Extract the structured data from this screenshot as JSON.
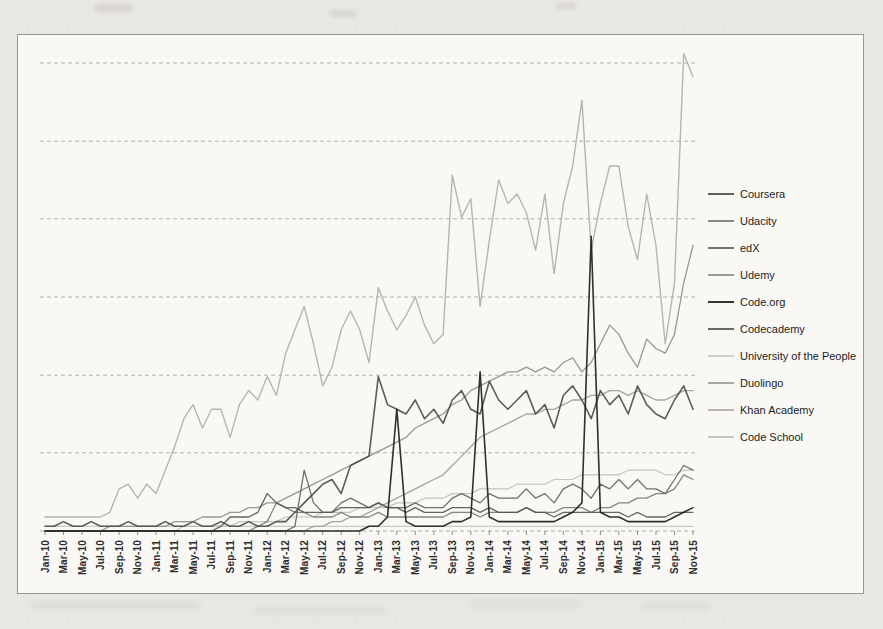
{
  "page": {
    "kind": "scanned book figure of an Excel-style line chart",
    "title": "",
    "background_color": "#e9e7e2",
    "plot_background_color": "#f9f8f4",
    "gridline_color": "#b0aea7",
    "frame_color": "#98968f"
  },
  "chart_data": {
    "type": "line",
    "title": "",
    "xlabel": "",
    "ylabel": "",
    "y_axis_labeled": false,
    "ylim": [
      0,
      105
    ],
    "y_gridline_values": [
      0,
      16.7,
      33.3,
      50,
      66.7,
      83.3,
      100
    ],
    "grid": "horizontal-only",
    "legend_position": "right",
    "n_points": 71,
    "x_points_per_label": 2,
    "x_range": "Jan-10 to Nov-15, monthly",
    "x_tick_labels": [
      "Jan-10",
      "Mar-10",
      "May-10",
      "Jul-10",
      "Sep-10",
      "Nov-10",
      "Jan-11",
      "Mar-11",
      "May-11",
      "Jul-11",
      "Sep-11",
      "Nov-11",
      "Jan-12",
      "Mar-12",
      "May-12",
      "Jul-12",
      "Sep-12",
      "Nov-12",
      "Jan-13",
      "Mar-13",
      "May-13",
      "Jul-13",
      "Sep-13",
      "Nov-13",
      "Jan-14",
      "Mar-14",
      "May-14",
      "Jul-14",
      "Sep-14",
      "Nov-14",
      "Jan-15",
      "Mar-15",
      "May-15",
      "Jul-15",
      "Sep-15",
      "Nov-15"
    ],
    "series": [
      {
        "name": "Coursera",
        "color": "#4e4e4e",
        "width": 1.6,
        "values": [
          1,
          1,
          2,
          1,
          1,
          2,
          1,
          1,
          1,
          2,
          1,
          1,
          1,
          2,
          1,
          1,
          2,
          1,
          1,
          2,
          1,
          1,
          2,
          1,
          1,
          2,
          2,
          4,
          6,
          8,
          10,
          11,
          8,
          14,
          15,
          16,
          33,
          27,
          26,
          25,
          28,
          24,
          26,
          23,
          28,
          30,
          26,
          25,
          32,
          28,
          26,
          28,
          30,
          25,
          27,
          22,
          29,
          31,
          28,
          24,
          30,
          27,
          29,
          25,
          31,
          27,
          25,
          24,
          28,
          31,
          26
        ]
      },
      {
        "name": "Udacity",
        "color": "#7b7b7b",
        "width": 1.3,
        "values": [
          0,
          0,
          0,
          0,
          0,
          0,
          0,
          0,
          0,
          0,
          0,
          0,
          0,
          0,
          0,
          0,
          0,
          0,
          0,
          0,
          0,
          0,
          0,
          1,
          2,
          6,
          5,
          4,
          4,
          3,
          3,
          3,
          4,
          3,
          3,
          3,
          4,
          3,
          3,
          3,
          3,
          3,
          3,
          3,
          4,
          4,
          4,
          3,
          4,
          4,
          4,
          4,
          5,
          4,
          4,
          4,
          5,
          5,
          5,
          4,
          5,
          5,
          6,
          6,
          7,
          7,
          8,
          8,
          9,
          12,
          11
        ]
      },
      {
        "name": "edX",
        "color": "#646464",
        "width": 1.3,
        "values": [
          0,
          0,
          0,
          0,
          0,
          0,
          0,
          0,
          0,
          0,
          0,
          0,
          0,
          0,
          0,
          0,
          0,
          0,
          0,
          0,
          0,
          0,
          0,
          0,
          0,
          0,
          0,
          1,
          13,
          6,
          4,
          4,
          6,
          7,
          6,
          5,
          6,
          5,
          5,
          5,
          6,
          5,
          5,
          5,
          7,
          8,
          7,
          6,
          8,
          7,
          7,
          7,
          9,
          7,
          8,
          6,
          9,
          10,
          9,
          7,
          10,
          9,
          11,
          9,
          11,
          9,
          9,
          8,
          11,
          14,
          13
        ]
      },
      {
        "name": "Udemy",
        "color": "#8f8f8f",
        "width": 1.3,
        "values": [
          0,
          0,
          0,
          0,
          0,
          0,
          0,
          1,
          1,
          1,
          1,
          1,
          1,
          1,
          2,
          2,
          2,
          3,
          3,
          3,
          4,
          4,
          5,
          5,
          6,
          6,
          7,
          8,
          9,
          10,
          11,
          12,
          13,
          14,
          15,
          16,
          17,
          18,
          19,
          20,
          22,
          23,
          24,
          25,
          27,
          28,
          30,
          31,
          32,
          33,
          34,
          34,
          35,
          34,
          35,
          34,
          36,
          37,
          34,
          36,
          40,
          44,
          42,
          38,
          35,
          41,
          39,
          38,
          42,
          53,
          61
        ]
      },
      {
        "name": "Code.org",
        "color": "#1e1e1e",
        "width": 1.6,
        "values": [
          0,
          0,
          0,
          0,
          0,
          0,
          0,
          0,
          0,
          0,
          0,
          0,
          0,
          0,
          0,
          0,
          0,
          0,
          0,
          0,
          0,
          0,
          0,
          0,
          0,
          0,
          0,
          0,
          0,
          0,
          0,
          0,
          0,
          0,
          0,
          1,
          1,
          3,
          26,
          2,
          1,
          1,
          1,
          1,
          2,
          2,
          3,
          34,
          3,
          2,
          2,
          2,
          2,
          2,
          2,
          2,
          3,
          4,
          6,
          63,
          4,
          3,
          3,
          2,
          2,
          2,
          2,
          2,
          3,
          4,
          5
        ]
      },
      {
        "name": "Codecademy",
        "color": "#585858",
        "width": 1.3,
        "values": [
          0,
          0,
          0,
          0,
          0,
          0,
          0,
          0,
          0,
          0,
          0,
          0,
          0,
          0,
          0,
          0,
          0,
          0,
          0,
          1,
          3,
          3,
          3,
          4,
          8,
          6,
          5,
          5,
          4,
          4,
          4,
          4,
          5,
          5,
          5,
          5,
          6,
          5,
          5,
          4,
          5,
          4,
          4,
          4,
          5,
          5,
          5,
          4,
          5,
          4,
          4,
          4,
          5,
          4,
          4,
          3,
          4,
          4,
          4,
          4,
          4,
          4,
          4,
          3,
          4,
          3,
          3,
          3,
          4,
          4,
          4
        ]
      },
      {
        "name": "University of the People",
        "color": "#c6c6c6",
        "width": 1.2,
        "values": [
          1,
          1,
          1,
          1,
          1,
          1,
          1,
          1,
          1,
          1,
          1,
          1,
          1,
          1,
          1,
          1,
          1,
          1,
          1,
          1,
          1,
          1,
          1,
          1,
          1,
          1,
          1,
          1,
          1,
          1,
          1,
          1,
          1,
          1,
          1,
          1,
          1,
          1,
          1,
          1,
          1,
          1,
          1,
          1,
          1,
          1,
          1,
          1,
          1,
          1,
          1,
          1,
          1,
          1,
          1,
          1,
          1,
          1,
          1,
          1,
          1,
          1,
          1,
          1,
          1,
          1,
          1,
          1,
          1,
          1,
          1
        ]
      },
      {
        "name": "Duolingo",
        "color": "#9d9d9d",
        "width": 1.3,
        "values": [
          0,
          0,
          0,
          0,
          0,
          0,
          0,
          0,
          0,
          0,
          0,
          0,
          0,
          0,
          0,
          0,
          0,
          0,
          0,
          0,
          0,
          0,
          0,
          0,
          0,
          0,
          0,
          0,
          0,
          1,
          1,
          2,
          2,
          3,
          3,
          4,
          5,
          6,
          7,
          8,
          9,
          10,
          11,
          12,
          14,
          16,
          18,
          20,
          21,
          22,
          23,
          24,
          25,
          25,
          26,
          26,
          27,
          28,
          28,
          29,
          29,
          30,
          30,
          29,
          30,
          29,
          28,
          28,
          29,
          30,
          30
        ]
      },
      {
        "name": "Khan Academy",
        "color": "#b1afa9",
        "width": 1.4,
        "values": [
          3,
          3,
          3,
          3,
          3,
          3,
          3,
          4,
          9,
          10,
          7,
          10,
          8,
          13,
          18,
          24,
          27,
          22,
          26,
          26,
          20,
          27,
          30,
          28,
          33,
          29,
          38,
          43,
          48,
          40,
          31,
          35,
          43,
          47,
          43,
          36,
          52,
          47,
          43,
          46,
          50,
          44,
          40,
          42,
          76,
          67,
          71,
          48,
          62,
          75,
          70,
          72,
          68,
          60,
          72,
          55,
          70,
          78,
          92,
          60,
          70,
          78,
          78,
          65,
          58,
          72,
          61,
          40,
          53,
          102,
          97
        ]
      },
      {
        "name": "Code School",
        "color": "#bfbfbf",
        "width": 1.2,
        "values": [
          0,
          0,
          0,
          0,
          0,
          0,
          0,
          0,
          0,
          0,
          0,
          0,
          0,
          0,
          0,
          1,
          1,
          1,
          1,
          1,
          1,
          2,
          2,
          2,
          2,
          2,
          3,
          3,
          3,
          3,
          4,
          4,
          4,
          4,
          5,
          5,
          5,
          5,
          6,
          6,
          6,
          7,
          7,
          7,
          8,
          8,
          8,
          9,
          9,
          9,
          9,
          10,
          10,
          10,
          10,
          11,
          11,
          11,
          12,
          12,
          12,
          12,
          12,
          13,
          13,
          13,
          13,
          12,
          12,
          13,
          13
        ]
      }
    ]
  }
}
